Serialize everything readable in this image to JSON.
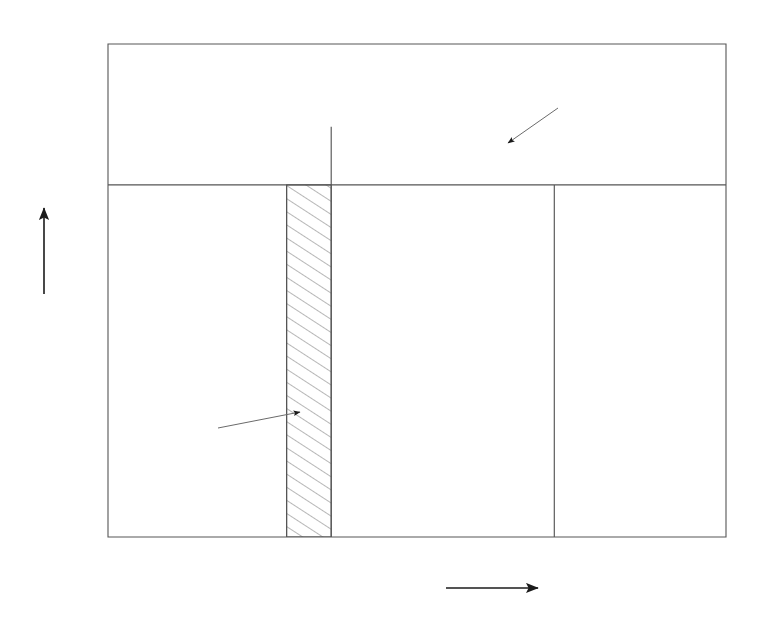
{
  "figure": {
    "title": "",
    "background_color": "#ffffff",
    "line_color": "#555555",
    "text_color": "#232323"
  },
  "axes": {
    "x_label": "δ",
    "x_label_arrow": "→",
    "y_label": "P",
    "y_label_sub": "e",
    "y_label_arrow": "↑",
    "x_ticks": [
      "0",
      "20",
      "40",
      "60",
      "80",
      "100",
      "120",
      "140",
      "160",
      "180"
    ],
    "x_tick_values": [
      0,
      20,
      40,
      60,
      80,
      100,
      120,
      140,
      160,
      180
    ],
    "y_ticks": [
      "0",
      "0.2",
      "0.4",
      "0.6",
      "0.8",
      "1",
      "1.2",
      "1.4"
    ],
    "y_tick_values": [
      0,
      0.2,
      0.4,
      0.6,
      0.8,
      1.0,
      1.2,
      1.4
    ],
    "xlim": [
      0,
      180
    ],
    "ylim": [
      0,
      1.4
    ]
  },
  "annotations": {
    "a1": {
      "label": "A",
      "sub": "1",
      "x": 196,
      "y": 433
    },
    "a2": {
      "label": "A",
      "sub": "2",
      "x": 566,
      "y": 101
    },
    "delta_p": {
      "label": "δ",
      "sub": "p",
      "x": 259,
      "y": 521,
      "value": 52
    },
    "delta_c": {
      "label": "δ",
      "sub": "c",
      "x": 340,
      "y": 521,
      "value": 65
    },
    "delta_max": {
      "label": "δ",
      "sub": "max",
      "x": 497,
      "y": 521,
      "value": 130
    }
  },
  "chart_data": {
    "type": "line",
    "xlabel": "δ",
    "ylabel": "P_e",
    "xlim": [
      0,
      180
    ],
    "ylim": [
      0,
      1.4
    ],
    "grid": false,
    "legend": null,
    "series": [
      {
        "name": "P_e = 1.285 sin(δ)",
        "kind": "sine",
        "amplitude": 1.285,
        "x": [
          0,
          10,
          20,
          30,
          40,
          50,
          52,
          60,
          65,
          70,
          80,
          90,
          100,
          110,
          120,
          130,
          140,
          150,
          160,
          170,
          180
        ],
        "y": [
          0,
          0.223,
          0.439,
          0.643,
          0.826,
          0.984,
          1.012,
          1.113,
          1.165,
          1.208,
          1.265,
          1.285,
          1.265,
          1.208,
          1.113,
          0.984,
          0.826,
          0.643,
          0.439,
          0.223,
          0
        ]
      },
      {
        "name": "P_m = 1.0 (mechanical power line)",
        "kind": "horizontal",
        "value": 1.0,
        "x": [
          0,
          180
        ],
        "y": [
          1.0,
          1.0
        ]
      }
    ],
    "vertical_lines": [
      {
        "name": "delta_p",
        "x": 52,
        "y_from": 0,
        "y_to": 1.0
      },
      {
        "name": "delta_c",
        "x": 65,
        "y_from": 0,
        "y_to": 1.165
      },
      {
        "name": "delta_max",
        "x": 130,
        "y_from": 0,
        "y_to": 1.0
      }
    ],
    "shaded_regions": [
      {
        "name": "A1",
        "label": "A₁",
        "hatched": true,
        "description": "Accelerating area: rectangle between δ_p=52° and δ_c=65° from P=0 up to P=1.0",
        "x_range": [
          52,
          65
        ],
        "y_range": [
          0,
          1.0
        ]
      },
      {
        "name": "A2",
        "label": "A₂",
        "hatched": true,
        "description": "Decelerating area: between the sine curve and P=1.0 from δ_c=65° to δ_max=130°",
        "x_range": [
          65,
          130
        ],
        "y_lower": 1.0,
        "y_upper": "1.285 sin(δ)"
      }
    ]
  }
}
